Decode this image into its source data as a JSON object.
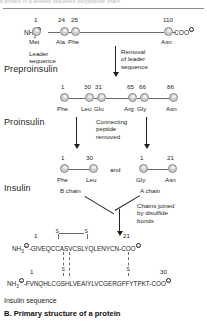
{
  "figure": {
    "top_bleed_text": "a protein in a defined sequence polypeptide chain",
    "caption_sub": "Insulin sequence",
    "caption_main": "B. Primary structure of a protein"
  },
  "preproinsulin": {
    "stage_label": "Preproinsulin",
    "n_terminus": "NH",
    "n_terminus_sub": "3",
    "n_terminus_charge": "+",
    "c_terminus": "COO",
    "c_terminus_charge": "–",
    "positions": [
      {
        "number": "1",
        "residue": "Met"
      },
      {
        "number": "24",
        "residue": "Ala"
      },
      {
        "number": "25",
        "residue": "Phe"
      },
      {
        "number": "110",
        "residue": "Asn"
      }
    ],
    "leader_note": "Leader\nsequence",
    "leader_note_line1": "Leader",
    "leader_note_line2": "sequence",
    "removal_note_line1": "Removal",
    "removal_note_line2": "of leader",
    "removal_note_line3": "sequence"
  },
  "proinsulin": {
    "stage_label": "Proinsulin",
    "positions": [
      {
        "number": "1",
        "residue": "Phe"
      },
      {
        "number": "30",
        "residue": "Leu"
      },
      {
        "number": "31",
        "residue": "Glu"
      },
      {
        "number": "65",
        "residue": "Arg"
      },
      {
        "number": "66",
        "residue": "Gly"
      },
      {
        "number": "86",
        "residue": "Asn"
      }
    ],
    "connecting_note_line1": "Connecting",
    "connecting_note_line2": "peptide",
    "connecting_note_line3": "removed"
  },
  "insulin": {
    "stage_label": "Insulin",
    "conjunction": "and",
    "b_chain": {
      "name": "B chain",
      "positions": [
        {
          "number": "1",
          "residue": "Phe"
        },
        {
          "number": "30",
          "residue": "Leu"
        }
      ]
    },
    "a_chain": {
      "name": "A chain",
      "positions": [
        {
          "number": "1",
          "residue": "Gly"
        },
        {
          "number": "21",
          "residue": "Asn"
        }
      ]
    },
    "bond_note_line1": "Chains joined",
    "bond_note_line2": "by disulfide",
    "bond_note_line3": "bonds"
  },
  "sequences": {
    "a_chain": {
      "n_terminus": "NH",
      "n_terminus_sub": "3",
      "n_terminus_charge": "+",
      "start_number": "1",
      "end_number": "21",
      "sequence": "-GIVEQCCASVCSLYQLENYCN-COO",
      "c_terminus_charge": "–",
      "intrachain_bond_labels": [
        "S",
        "S"
      ]
    },
    "b_chain": {
      "n_terminus": "NH",
      "n_terminus_sub": "3",
      "n_terminus_charge": "+",
      "start_number": "1",
      "end_number": "30",
      "sequence": "-FVNQHLCGSHLVEAIYLVCGERGFFYTPKT-COO",
      "c_terminus_charge": "–",
      "interchain_bond_labels": [
        "S",
        "S"
      ]
    }
  },
  "colors": {
    "bead_fill": "#cfcccb",
    "bead_stroke": "#8d8a88",
    "ink": "#231f20",
    "line": "#6f6b68"
  }
}
